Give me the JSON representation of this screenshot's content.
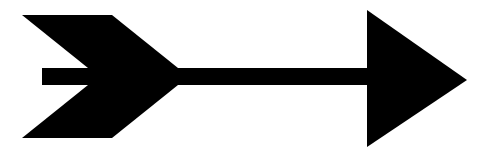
{
  "image": {
    "subject": "arrow pointing right",
    "colors": {
      "fill": "#000000",
      "background": "#ffffff"
    },
    "shaft": {
      "x1": 42,
      "x2": 372,
      "y_top": 68,
      "y_bottom": 85
    },
    "head": {
      "points": "367,10 467,80 367,147"
    },
    "fletching_top": [
      "22,15 58,15 124,68 88,68",
      "48,15 84,15 150,68 114,68",
      "76,15 112,15 178,68 142,68"
    ],
    "fletching_bottom": [
      "88,85 124,85 58,138 22,138",
      "114,85 150,85 84,138 48,138",
      "142,85 178,85 112,138 76,138"
    ]
  }
}
